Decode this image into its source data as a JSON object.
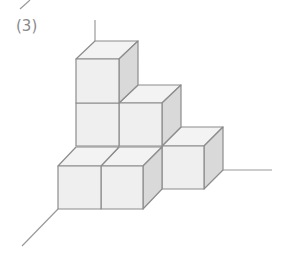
{
  "figure": {
    "label": "(3)",
    "cube_count": 6,
    "colors": {
      "front_face": "#efefef",
      "top_face": "#f3f3f3",
      "side_face": "#d9d9d9",
      "edge": "#8c8c8c",
      "axis": "#9a9a9a"
    }
  }
}
